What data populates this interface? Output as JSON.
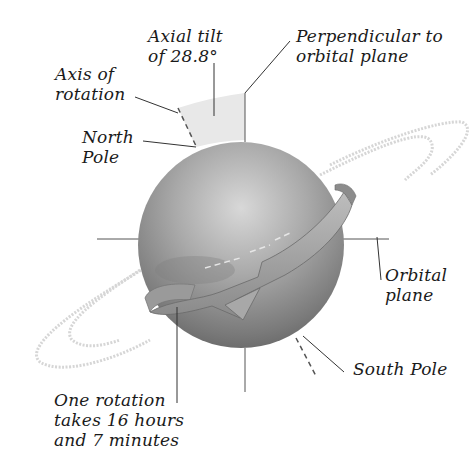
{
  "diagram": {
    "labels": {
      "axial_tilt": [
        "Axial tilt",
        "of 28.8°"
      ],
      "perpendicular": [
        "Perpendicular to",
        "orbital plane"
      ],
      "axis_of_rotation": [
        "Axis of",
        "rotation"
      ],
      "north_pole": [
        "North",
        "Pole"
      ],
      "orbital_plane": [
        "Orbital",
        "plane"
      ],
      "south_pole": [
        "South Pole"
      ],
      "rotation_period": [
        "One rotation",
        "takes 16 hours",
        "and 7 minutes"
      ]
    },
    "values": {
      "axial_tilt_degrees": 28.8,
      "rotation_hours": 16,
      "rotation_minutes": 7
    },
    "colors": {
      "sphere_light": "#c9c9c9",
      "sphere_dark": "#6e6e6e",
      "wedge": "#e6e6e6",
      "ring": "#d4d4d4",
      "line": "#333333"
    }
  }
}
